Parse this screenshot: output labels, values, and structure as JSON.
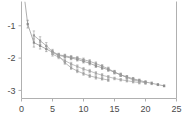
{
  "chart_data": {
    "type": "line",
    "title": "",
    "subtitle": "",
    "xlabel": "",
    "ylabel": "",
    "xlim": [
      0,
      25
    ],
    "ylim": [
      -3.25,
      -0.25
    ],
    "grid": false,
    "legend_position": "none",
    "xticks": [
      0,
      5,
      10,
      15,
      20,
      25
    ],
    "xticklabels": [
      "0",
      "5",
      "10",
      "15",
      "20",
      "25"
    ],
    "yticks": [
      -1,
      -2,
      -3
    ],
    "yticklabels": [
      "-1",
      "-2",
      "-3"
    ],
    "colors": {
      "series_1": "#8c8c8c",
      "series_2": "#9a9a9a",
      "series_3": "#a6a6a6",
      "axis": "#b0b0b0",
      "text": "#4a4a4a",
      "background": "#ffffff"
    },
    "marker": "square",
    "errorbars": true,
    "series": [
      {
        "name": "series_1",
        "color": "#8c8c8c",
        "x": [
          1,
          2,
          3,
          4,
          5,
          6,
          7,
          8,
          9,
          10,
          11,
          12,
          13,
          14,
          15,
          16,
          17,
          18,
          19,
          20,
          21,
          22,
          23
        ],
        "y": [
          -0.95,
          -1.52,
          -1.62,
          -1.72,
          -1.82,
          -1.92,
          -1.95,
          -2.0,
          -2.04,
          -2.1,
          -2.16,
          -2.24,
          -2.3,
          -2.36,
          -2.44,
          -2.52,
          -2.58,
          -2.64,
          -2.69,
          -2.74,
          -2.78,
          -2.82,
          -2.86
        ],
        "yerr": [
          0.12,
          0.14,
          0.1,
          0.08,
          0.06,
          0.05,
          0.05,
          0.05,
          0.05,
          0.05,
          0.05,
          0.05,
          0.05,
          0.05,
          0.05,
          0.05,
          0.04,
          0.04,
          0.04,
          0.04,
          0.04,
          0.03,
          0.03
        ]
      },
      {
        "name": "series_2",
        "color": "#9a9a9a",
        "x": [
          2,
          3,
          4,
          5,
          6,
          7,
          8,
          9,
          10,
          11,
          12,
          13,
          14,
          15,
          16,
          17,
          18,
          19,
          20
        ],
        "y": [
          -1.3,
          -1.46,
          -1.62,
          -1.8,
          -1.9,
          -1.93,
          -1.97,
          -2.0,
          -2.05,
          -2.1,
          -2.17,
          -2.25,
          -2.33,
          -2.43,
          -2.52,
          -2.6,
          -2.67,
          -2.72,
          -2.77
        ],
        "yerr": [
          0.14,
          0.12,
          0.1,
          0.07,
          0.05,
          0.05,
          0.05,
          0.05,
          0.05,
          0.05,
          0.05,
          0.05,
          0.05,
          0.05,
          0.05,
          0.04,
          0.04,
          0.04,
          0.04
        ]
      },
      {
        "name": "series_3",
        "color": "#a6a6a6",
        "x": [
          5,
          6,
          7,
          8,
          9,
          10,
          11,
          12,
          13,
          14,
          15,
          16,
          17,
          18,
          19
        ],
        "y": [
          -1.88,
          -1.97,
          -2.08,
          -2.18,
          -2.26,
          -2.34,
          -2.4,
          -2.47,
          -2.53,
          -2.58,
          -2.63,
          -2.67,
          -2.7,
          -2.73,
          -2.76
        ],
        "yerr": [
          0.06,
          0.05,
          0.05,
          0.05,
          0.05,
          0.05,
          0.05,
          0.05,
          0.05,
          0.04,
          0.04,
          0.04,
          0.04,
          0.04,
          0.04
        ]
      },
      {
        "name": "series_4",
        "color": "#a0a0a0",
        "x": [
          6,
          7,
          8,
          9,
          10,
          11,
          12,
          13,
          14
        ],
        "y": [
          -1.93,
          -2.14,
          -2.3,
          -2.4,
          -2.48,
          -2.55,
          -2.6,
          -2.64,
          -2.68
        ],
        "yerr": [
          0.05,
          0.05,
          0.05,
          0.05,
          0.05,
          0.05,
          0.05,
          0.04,
          0.04
        ]
      }
    ]
  }
}
